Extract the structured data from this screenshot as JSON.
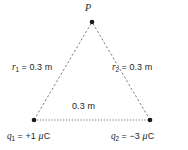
{
  "figure": {
    "name": "two-point-charge-equilateral-triangle-diagram",
    "background_color": "#ffffff",
    "line_color": "#555555",
    "text_color": "#262626",
    "vertices": {
      "apex": {
        "label": "P",
        "x": 92,
        "y": 22
      },
      "bottom_left": {
        "x": 34,
        "y": 120
      },
      "bottom_right": {
        "x": 150,
        "y": 120
      }
    },
    "labels": {
      "point_p": "P",
      "r1": {
        "symbol": "r",
        "subscript": "1",
        "equals": "=",
        "value": "0.3",
        "unit": "m"
      },
      "r2": {
        "symbol": "r",
        "subscript": "2",
        "equals": "=",
        "value": "0.3",
        "unit": "m"
      },
      "base": {
        "value": "0.3",
        "unit": "m",
        "text": "0.3 m"
      },
      "q1": {
        "symbol": "q",
        "subscript": "1",
        "equals": "=",
        "value": "+1",
        "unit_prefix": "μ",
        "unit": "C"
      },
      "q2": {
        "symbol": "q",
        "subscript": "2",
        "equals": "=",
        "value": "−3",
        "unit_prefix": "μ",
        "unit": "C"
      }
    }
  }
}
